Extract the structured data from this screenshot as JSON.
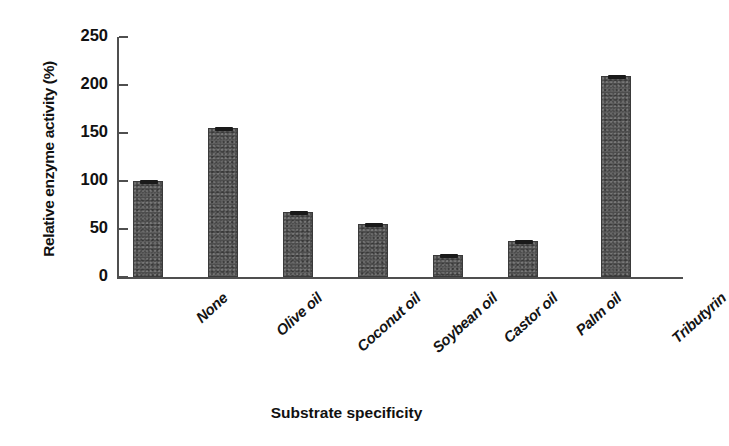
{
  "chart_data": {
    "type": "bar",
    "title": "",
    "xlabel": "Substrate specificity",
    "ylabel": "Relative enzyme activity (%)",
    "categories": [
      "None",
      "Olive oil",
      "Coconut oil",
      "Soybean oil",
      "Castor oil",
      "Palm oil",
      "Tributyrin"
    ],
    "values": [
      100,
      155,
      68,
      55,
      23,
      38,
      209
    ],
    "ylim": [
      0,
      250
    ],
    "yticks": [
      0,
      50,
      100,
      150,
      200,
      250
    ],
    "ytick_labels": [
      "0",
      "50",
      "100",
      "150",
      "200",
      "250"
    ],
    "grid": false,
    "legend": false,
    "bar_color": "#4d4d4d",
    "axis_color": "#4f4f4f",
    "series": [
      {
        "name": "Relative enzyme activity",
        "values": [
          100,
          155,
          68,
          55,
          23,
          38,
          209
        ]
      }
    ]
  }
}
